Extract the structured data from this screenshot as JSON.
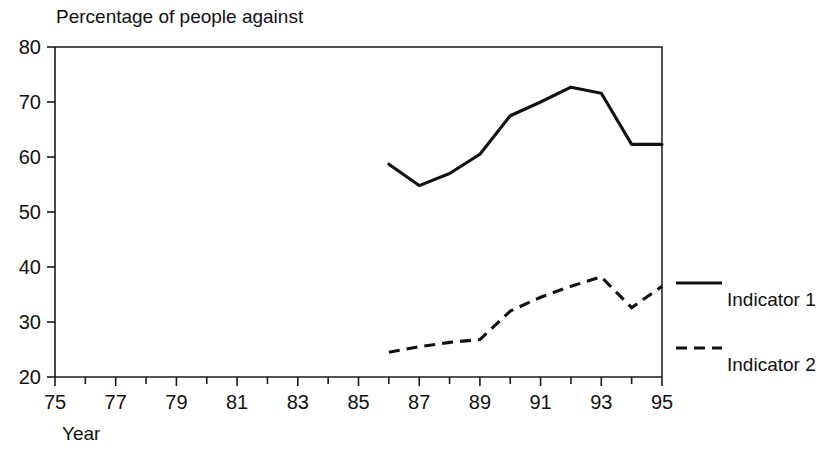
{
  "chart_data": {
    "type": "line",
    "title": "Percentage of people against",
    "xlabel": "Year",
    "ylabel": "",
    "xlim": [
      75,
      95
    ],
    "ylim": [
      20,
      80
    ],
    "grid": false,
    "legend_position": "right",
    "xticks": [
      "75",
      "77",
      "79",
      "81",
      "83",
      "85",
      "87",
      "89",
      "91",
      "93",
      "95"
    ],
    "xtick_values": [
      75,
      77,
      79,
      81,
      83,
      85,
      87,
      89,
      91,
      93,
      95
    ],
    "xtick_minor_values": [
      76,
      78,
      80,
      82,
      84,
      86,
      88,
      90,
      92,
      94
    ],
    "yticks": [
      "20",
      "30",
      "40",
      "50",
      "60",
      "70",
      "80"
    ],
    "ytick_values": [
      20,
      30,
      40,
      50,
      60,
      70,
      80
    ],
    "x": [
      86,
      87,
      88,
      89,
      90,
      91,
      92,
      93,
      94,
      95
    ],
    "series": [
      {
        "name": "Indicator 1",
        "style": "solid",
        "color": "#111111",
        "values": [
          58.7,
          54.8,
          57.0,
          60.5,
          67.5,
          70.0,
          72.7,
          71.6,
          62.3,
          62.3
        ]
      },
      {
        "name": "Indicator 2",
        "style": "dashed",
        "color": "#111111",
        "values": [
          24.5,
          25.5,
          26.3,
          26.8,
          32.0,
          34.5,
          36.5,
          38.2,
          32.6,
          36.5
        ]
      }
    ]
  },
  "legend": {
    "items": [
      {
        "label": "Indicator 1",
        "style": "solid"
      },
      {
        "label": "Indicator 2",
        "style": "dashed"
      }
    ]
  },
  "colors": {
    "ink": "#111111",
    "background": "#ffffff"
  }
}
